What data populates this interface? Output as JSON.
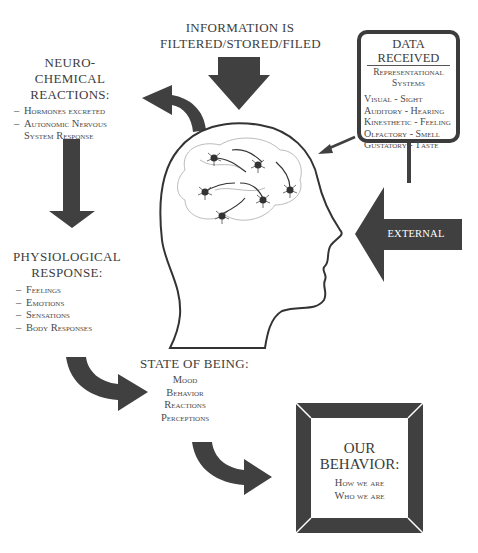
{
  "diagram": {
    "top_label": {
      "line1": "INFORMATION IS",
      "line2": "FILTERED/STORED/FILED"
    },
    "neuro_chemical": {
      "title_line1": "NEURO-CHEMICAL",
      "title_line2": "REACTIONS:",
      "items": [
        "Hormones excreted",
        "Autonomic Nervous",
        "System Response"
      ]
    },
    "data_received": {
      "title": "DATA RECEIVED",
      "subtitle_line1": "Representational",
      "subtitle_line2": "Systems",
      "items": [
        "Visual - Sight",
        "Auditory - Hearing",
        "Kinesthetic - Feeling",
        "Olfactory - Smell",
        "Gustatory - Taste"
      ]
    },
    "external_event": {
      "label": "EXTERNAL EVENT"
    },
    "physiological": {
      "title_line1": "PHYSIOLOGICAL",
      "title_line2": "RESPONSE:",
      "items": [
        "Feelings",
        "Emotions",
        "Sensations",
        "Body Responses"
      ]
    },
    "state_of_being": {
      "title": "STATE OF BEING:",
      "items": [
        "Mood",
        "Behavior",
        "Reactions",
        "Perceptions"
      ]
    },
    "our_behavior": {
      "title_line1": "OUR",
      "title_line2": "BEHAVIOR:",
      "items": [
        "How we are",
        "Who we are"
      ]
    },
    "icons": [
      "head-silhouette-icon",
      "neuron-network-icon",
      "down-arrow-icon",
      "curved-arrow-icon",
      "left-arrow-icon"
    ],
    "colors": {
      "arrow_fill": "#3f3f3f",
      "text": "#3d3d3d",
      "background": "#ffffff"
    }
  }
}
